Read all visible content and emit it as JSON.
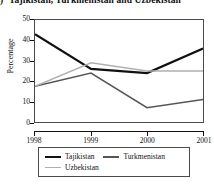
{
  "title": {
    "prefix": ")",
    "text": "Tajikistan, Turkmenistan and Uzbekistan"
  },
  "axes": {
    "ylabel": "Percentage",
    "yticks": [
      "0",
      "10",
      "20",
      "30",
      "40",
      "50"
    ],
    "xticks": [
      "1998",
      "1999",
      "2000",
      "2001"
    ]
  },
  "legend": {
    "items": [
      {
        "label": "Tajikistan",
        "color": "#111111"
      },
      {
        "label": "Turkmenistan",
        "color": "#555555"
      },
      {
        "label": "Uzbekistan",
        "color": "#b0b0b0"
      }
    ]
  },
  "chart_data": {
    "type": "line",
    "title": "Tajikistan, Turkmenistan and Uzbekistan",
    "xlabel": "",
    "ylabel": "Percentage",
    "x": [
      "1998",
      "1999",
      "2000",
      "2001"
    ],
    "categories": [
      "1998",
      "1999",
      "2000",
      "2001"
    ],
    "ylim": [
      0,
      50
    ],
    "xlim": [
      1998,
      2001
    ],
    "ytick_step": 10,
    "grid": false,
    "legend_position": "bottom",
    "series": [
      {
        "name": "Tajikistan",
        "color": "#111111",
        "width": 2.2,
        "values": [
          43,
          26,
          24,
          36
        ]
      },
      {
        "name": "Turkmenistan",
        "color": "#555555",
        "width": 1.6,
        "values": [
          17.5,
          24,
          7,
          11
        ]
      },
      {
        "name": "Uzbekistan",
        "color": "#b0b0b0",
        "width": 1.4,
        "values": [
          17.5,
          29,
          25,
          25
        ]
      }
    ]
  }
}
